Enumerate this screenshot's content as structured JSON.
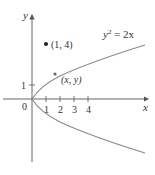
{
  "figure": {
    "axes": {
      "x_label": "x",
      "y_label": "y",
      "origin_label": "0",
      "x_ticks": [
        "1",
        "2",
        "3",
        "4"
      ],
      "y_ticks": [
        "1"
      ]
    },
    "curve": {
      "equation_lhs": "y",
      "equation_exp": "2",
      "equation_rhs": " = 2x",
      "color": "#8a8a8a"
    },
    "points": [
      {
        "label": "(1, 4)",
        "x": 1,
        "y": 4
      },
      {
        "label": "(x, y)"
      }
    ],
    "colors": {
      "axis": "#555555",
      "text": "#333333",
      "point": "#222222"
    }
  }
}
